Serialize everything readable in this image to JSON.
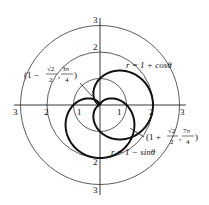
{
  "figure": {
    "center": [
      100,
      105
    ],
    "unit_px": 26.5,
    "reference_circles": [
      1,
      2,
      3
    ],
    "curves": [
      {
        "name": "r = 1 + cosθ",
        "equation": "1+cos",
        "label": "r = 1 + cosθ"
      },
      {
        "name": "r = 1 - sinθ",
        "equation": "1-sin",
        "label": "r = 1 − sinθ"
      }
    ],
    "axis_ticks": {
      "left": [
        "3",
        "2",
        "1"
      ],
      "right": [
        "1",
        "2",
        "3"
      ],
      "top": [
        "2",
        "3"
      ],
      "bottom": [
        "2",
        "3"
      ]
    },
    "annotations": [
      {
        "label": "(1 − √2/2, 3π/4)",
        "point": "intersection-upper-left"
      },
      {
        "label": "(1 + √2/2, 7π/4)",
        "point": "intersection-lower-right"
      }
    ]
  },
  "labels": {
    "curve1": "r = 1 + cosθ",
    "curve2": "r = 1 − sinθ",
    "p1_open": "(1 −",
    "p1_num": "√2",
    "p1_den": "2",
    "p1_angle_num": "3π",
    "p1_angle_den": "4",
    "p2_open": "(1 +",
    "p2_num": "√2",
    "p2_den": "2",
    "p2_angle_num": "7π",
    "p2_angle_den": "4",
    "tick_l3": "3",
    "tick_l2": "2",
    "tick_l1": "1",
    "tick_r1": "1",
    "tick_r2": "2",
    "tick_r3": "3",
    "tick_t2": "2",
    "tick_t3": "3",
    "tick_b2": "2",
    "tick_b3": "3"
  }
}
